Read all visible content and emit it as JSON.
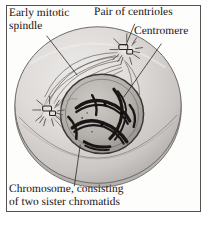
{
  "figure": {
    "name": "early-mitosis-cell-diagram",
    "frame_color": "#555052",
    "background_color": "#ffffff"
  },
  "labels": {
    "spindle": "Early mitotic\nspindle",
    "centrioles": "Pair of centrioles",
    "centromere": "Centromere",
    "chromosome": "Chromosome, consisting\nof two sister chromatids"
  },
  "structures": {
    "cell": {
      "name": "cell-body",
      "fill_light": "#e6e4e2",
      "fill_mid": "#cfcdcb",
      "fill_dark": "#a8a5a3",
      "outline": "#6b6765"
    },
    "nucleus": {
      "name": "nucleus",
      "fill": "#b9b6b2",
      "outline": "#3b3735"
    },
    "chromosomes": {
      "name": "chromosome-threads",
      "color": "#1a1716"
    },
    "centrosome_left": {
      "name": "centrosome-left",
      "ray_color": "#4a4644",
      "centriole_color": "#dedbd8"
    },
    "centrosome_right": {
      "name": "centrosome-right",
      "ray_color": "#4a4644",
      "centriole_color": "#dedbd8"
    },
    "spindle_fibers": {
      "name": "spindle-fibers",
      "color": "#5e5a58"
    },
    "leader_lines": {
      "name": "leader-lines",
      "color": "#2a2624"
    }
  }
}
